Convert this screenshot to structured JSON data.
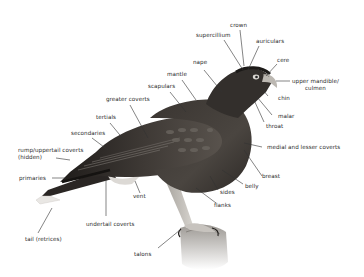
{
  "diagram": {
    "labels": {
      "crown": "crown",
      "supercilium": "supercillium",
      "auriculars": "auriculars",
      "cere": "cere",
      "nape": "nape",
      "upper_mandible": "upper mandible/\nculmen",
      "mantle": "mantle",
      "scapulars": "scapulars",
      "chin": "chin",
      "greater_coverts": "greater coverts",
      "malar": "malar",
      "throat": "throat",
      "tertials": "tertials",
      "secondaries": "secondaries",
      "medial_lesser_coverts": "medial and lesser coverts",
      "rump": "rump/uppertail coverts\n(hidden)",
      "breast": "breast",
      "primaries": "primaries",
      "belly": "belly",
      "sides": "sides",
      "vent": "vent",
      "flanks": "flanks",
      "undertail_coverts": "undertail coverts",
      "tail": "tail (retrices)",
      "talons": "talons"
    },
    "colors": {
      "background": "#ffffff",
      "label_text": "#2a2a2a",
      "leader_line": "#333333",
      "plumage_dark": "#2e2a27",
      "plumage_mid": "#55504b",
      "plumage_light": "#8a857f",
      "perch": "#b9b6b2"
    }
  }
}
